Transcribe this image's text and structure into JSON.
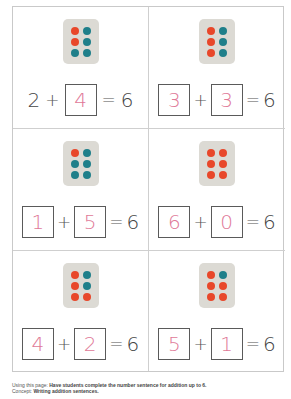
{
  "colors": {
    "red_dot": "#e8472a",
    "teal_dot": "#1f7f8a",
    "die_bg": "#dcdad4",
    "answer_ink": "#e07897",
    "border": "#c9c9c9"
  },
  "cards": [
    {
      "dots": [
        "red",
        "teal",
        "red",
        "teal",
        "teal",
        "teal"
      ],
      "addend1": "2",
      "addend1_boxed": false,
      "plus": "+",
      "addend2": "4",
      "addend2_boxed": true,
      "equals": "=",
      "sum": "6"
    },
    {
      "dots": [
        "red",
        "teal",
        "red",
        "teal",
        "red",
        "teal"
      ],
      "addend1": "3",
      "addend1_boxed": true,
      "plus": "+",
      "addend2": "3",
      "addend2_boxed": true,
      "equals": "=",
      "sum": "6"
    },
    {
      "dots": [
        "red",
        "teal",
        "teal",
        "teal",
        "teal",
        "teal"
      ],
      "addend1": "1",
      "addend1_boxed": true,
      "plus": "+",
      "addend2": "5",
      "addend2_boxed": true,
      "equals": "=",
      "sum": "6"
    },
    {
      "dots": [
        "red",
        "red",
        "red",
        "red",
        "red",
        "red"
      ],
      "addend1": "6",
      "addend1_boxed": true,
      "plus": "+",
      "addend2": "0",
      "addend2_boxed": true,
      "equals": "=",
      "sum": "6"
    },
    {
      "dots": [
        "red",
        "teal",
        "red",
        "teal",
        "red",
        "red"
      ],
      "addend1": "4",
      "addend1_boxed": true,
      "plus": "+",
      "addend2": "2",
      "addend2_boxed": true,
      "equals": "=",
      "sum": "6"
    },
    {
      "dots": [
        "red",
        "teal",
        "red",
        "red",
        "red",
        "red"
      ],
      "addend1": "5",
      "addend1_boxed": true,
      "plus": "+",
      "addend2": "1",
      "addend2_boxed": true,
      "equals": "=",
      "sum": "6"
    }
  ],
  "footer": {
    "line1_label": "Using this page:",
    "line1_text": "Have students complete the number sentence for addition up to 6.",
    "line2_label": "Concept:",
    "line2_text": "Writing addition sentences."
  }
}
